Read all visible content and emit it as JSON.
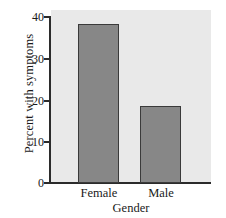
{
  "chart_data": {
    "type": "bar",
    "title": "",
    "categories": [
      "Female",
      "Male"
    ],
    "values": [
      38.2,
      18.4
    ],
    "xlabel": "Gender",
    "ylabel": "Percent with symptoms",
    "ylim": [
      0,
      40
    ],
    "yticks": [
      0,
      10,
      20,
      30,
      40
    ],
    "ytick_labels": [
      "0",
      "10",
      "20",
      "30",
      "40"
    ],
    "grid": false,
    "legend": "none",
    "colors": {
      "bar_fill": "#878787",
      "bar_border": "#3a3a3a",
      "panel_background": "#e9e9e9",
      "axis": "#2b2b2b",
      "text": "#1a1a1a",
      "figure_background": "#ffffff"
    }
  }
}
